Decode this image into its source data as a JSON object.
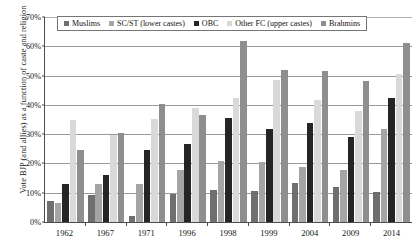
{
  "chart_data": {
    "type": "bar",
    "title": "",
    "subtitle": "",
    "xlabel": "",
    "ylabel": "Vote BJP (and allies) as a function of caste and religion",
    "categories": [
      "1962",
      "1967",
      "1971",
      "1996",
      "1998",
      "1999",
      "2004",
      "2009",
      "2014"
    ],
    "ylim": [
      0,
      70
    ],
    "ytick_labels": [
      "0%",
      "10%",
      "20%",
      "30%",
      "40%",
      "50%",
      "60%",
      "70%"
    ],
    "ytick_values": [
      0,
      10,
      20,
      30,
      40,
      50,
      60,
      70
    ],
    "grid": true,
    "legend_position": "top-inside",
    "value_suffix": "%",
    "series": [
      {
        "name": "Muslims",
        "color": "#6f6f6f",
        "values": [
          7.3,
          9.2,
          2.0,
          9.6,
          11.0,
          10.7,
          13.4,
          11.8,
          10.4
        ]
      },
      {
        "name": "SC/ST (lower castes)",
        "color": "#a5a5a5",
        "values": [
          6.5,
          13.0,
          13.0,
          17.9,
          20.7,
          20.4,
          18.7,
          17.7,
          31.8
        ]
      },
      {
        "name": "OBC",
        "color": "#252525",
        "values": [
          12.9,
          15.9,
          24.5,
          26.8,
          35.4,
          31.6,
          33.8,
          29.0,
          42.4
        ]
      },
      {
        "name": "Other FC (upper castes)",
        "color": "#d9d9d9",
        "values": [
          35.0,
          29.6,
          35.2,
          38.8,
          42.2,
          48.5,
          41.7,
          38.0,
          50.5
        ]
      },
      {
        "name": "Brahmins",
        "color": "#8e8e8e",
        "values": [
          24.6,
          30.5,
          40.3,
          36.6,
          61.9,
          51.8,
          51.4,
          48.3,
          61.1
        ]
      }
    ]
  }
}
